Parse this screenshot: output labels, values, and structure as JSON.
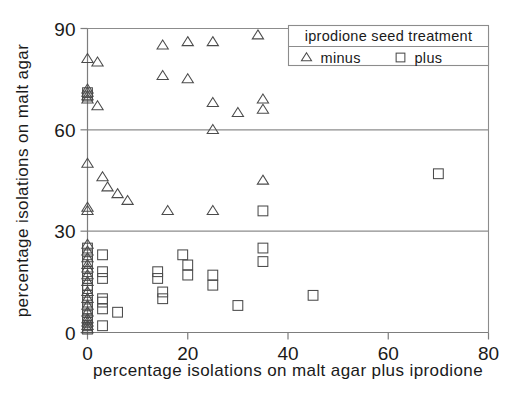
{
  "chart_data": {
    "type": "scatter",
    "title": "",
    "xlabel": "percentage isolations on malt agar plus iprodione",
    "ylabel": "percentage isolations on malt agar",
    "xlim": [
      0,
      80
    ],
    "ylim": [
      0,
      90
    ],
    "xticks": [
      0,
      20,
      40,
      60,
      80
    ],
    "yticks": [
      0,
      30,
      60,
      90
    ],
    "xtick_labels": [
      "0",
      "20",
      "40",
      "60",
      "80"
    ],
    "ytick_labels": [
      "0",
      "30",
      "60",
      "90"
    ],
    "grid": "horizontal",
    "legend": {
      "title": "iprodione seed treatment",
      "position": "top-right",
      "entries": [
        {
          "label": "minus",
          "marker": "triangle-up-open"
        },
        {
          "label": "plus",
          "marker": "square-open"
        }
      ]
    },
    "series": [
      {
        "name": "minus",
        "marker": "triangle-up-open",
        "points": [
          [
            0,
            81
          ],
          [
            0,
            72
          ],
          [
            0,
            71
          ],
          [
            0,
            70
          ],
          [
            0,
            69
          ],
          [
            0,
            50
          ],
          [
            0,
            37
          ],
          [
            0,
            36
          ],
          [
            0,
            26
          ],
          [
            0,
            24
          ],
          [
            0,
            22
          ],
          [
            0,
            20
          ],
          [
            0,
            19
          ],
          [
            0,
            17
          ],
          [
            0,
            15
          ],
          [
            0,
            12
          ],
          [
            0,
            10
          ],
          [
            0,
            8
          ],
          [
            0,
            6
          ],
          [
            0,
            4
          ],
          [
            0,
            3
          ],
          [
            0,
            2
          ],
          [
            0,
            1
          ],
          [
            2,
            80
          ],
          [
            2,
            67
          ],
          [
            3,
            46
          ],
          [
            4,
            43
          ],
          [
            6,
            41
          ],
          [
            8,
            39
          ],
          [
            15,
            85
          ],
          [
            15,
            76
          ],
          [
            16,
            36
          ],
          [
            20,
            86
          ],
          [
            20,
            75
          ],
          [
            25,
            86
          ],
          [
            25,
            68
          ],
          [
            25,
            60
          ],
          [
            25,
            36
          ],
          [
            30,
            65
          ],
          [
            34,
            88
          ],
          [
            35,
            69
          ],
          [
            35,
            66
          ],
          [
            35,
            45
          ]
        ]
      },
      {
        "name": "plus",
        "marker": "square-open",
        "points": [
          [
            0,
            71
          ],
          [
            0,
            70
          ],
          [
            0,
            25
          ],
          [
            0,
            23
          ],
          [
            0,
            21
          ],
          [
            0,
            18
          ],
          [
            0,
            16
          ],
          [
            0,
            14
          ],
          [
            0,
            13
          ],
          [
            0,
            11
          ],
          [
            0,
            9
          ],
          [
            0,
            7
          ],
          [
            0,
            5
          ],
          [
            0,
            4
          ],
          [
            0,
            3
          ],
          [
            0,
            2
          ],
          [
            0,
            1
          ],
          [
            3,
            23
          ],
          [
            3,
            18
          ],
          [
            3,
            16
          ],
          [
            3,
            10
          ],
          [
            3,
            9
          ],
          [
            3,
            7
          ],
          [
            3,
            2
          ],
          [
            6,
            6
          ],
          [
            14,
            18
          ],
          [
            14,
            16
          ],
          [
            15,
            12
          ],
          [
            15,
            10
          ],
          [
            19,
            23
          ],
          [
            20,
            20
          ],
          [
            20,
            17
          ],
          [
            25,
            17
          ],
          [
            25,
            14
          ],
          [
            30,
            8
          ],
          [
            35,
            36
          ],
          [
            35,
            25
          ],
          [
            35,
            21
          ],
          [
            45,
            11
          ],
          [
            70,
            47
          ]
        ]
      }
    ]
  }
}
